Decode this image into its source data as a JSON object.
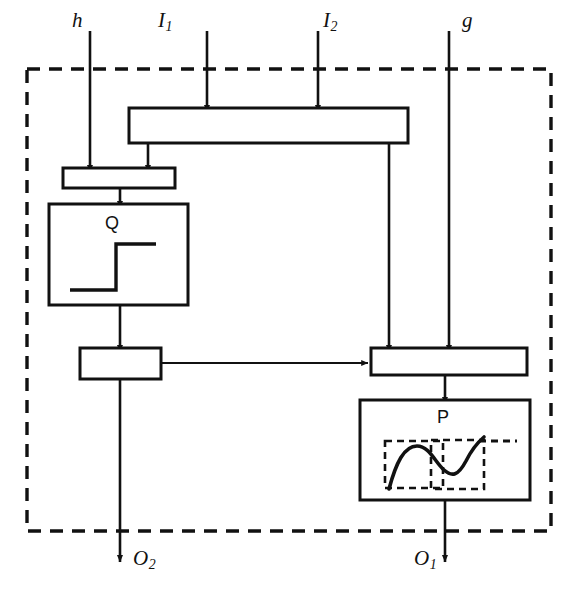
{
  "diagram": {
    "type": "block-diagram",
    "title": "",
    "boundary": {
      "style": "dashed",
      "x": 27,
      "y": 69,
      "width": 524,
      "height": 462
    },
    "colors": {
      "line": "#111111",
      "background": "#ffffff",
      "dashed": "#111111"
    },
    "inputs": [
      {
        "id": "h",
        "label": "h",
        "sub": "",
        "x": 90,
        "label_x": 72,
        "label_y": 10,
        "terminates_at": "splitter-box"
      },
      {
        "id": "I1",
        "label": "I",
        "sub": "1",
        "x": 207,
        "label_x": 158,
        "label_y": 10,
        "terminates_at": "top-bar"
      },
      {
        "id": "I2",
        "label": "I",
        "sub": "2",
        "x": 318,
        "label_x": 323,
        "label_y": 10,
        "terminates_at": "top-bar"
      },
      {
        "id": "g",
        "label": "g",
        "sub": "",
        "x": 449,
        "label_x": 462,
        "label_y": 10,
        "terminates_at": "right-bar"
      }
    ],
    "outputs": [
      {
        "id": "O1",
        "label": "O",
        "sub": "1",
        "x": 445,
        "label_x": 414,
        "label_y": 548,
        "source": "p-block"
      },
      {
        "id": "O2",
        "label": "O",
        "sub": "2",
        "x": 120,
        "label_x": 133,
        "label_y": 548,
        "source": "left-mid-box"
      }
    ],
    "blocks": [
      {
        "id": "top-bar",
        "label": "",
        "x": 129,
        "y": 108,
        "width": 279,
        "height": 35
      },
      {
        "id": "splitter-box",
        "label": "",
        "x": 63,
        "y": 168,
        "width": 112,
        "height": 20
      },
      {
        "id": "q-block",
        "label": "Q",
        "x": 49,
        "y": 204,
        "width": 139,
        "height": 101,
        "label_x": 105,
        "label_y": 214,
        "glyph": "step-function"
      },
      {
        "id": "left-mid-box",
        "label": "",
        "x": 80,
        "y": 348,
        "width": 81,
        "height": 31
      },
      {
        "id": "right-bar",
        "label": "",
        "x": 371,
        "y": 348,
        "width": 156,
        "height": 27
      },
      {
        "id": "p-block",
        "label": "P",
        "x": 360,
        "y": 400,
        "width": 170,
        "height": 100,
        "label_x": 437,
        "label_y": 408,
        "glyph": "s-curve-with-dashed-boxes"
      }
    ],
    "connections": [
      {
        "from": "top-bar",
        "to": "splitter-box",
        "x": 148,
        "kind": "vertical-arrow"
      },
      {
        "from": "top-bar",
        "to": "right-bar",
        "x": 389,
        "kind": "vertical-arrow"
      },
      {
        "from": "splitter-box",
        "to": "q-block",
        "x": 120,
        "kind": "vertical-arrow"
      },
      {
        "from": "q-block",
        "to": "left-mid-box",
        "x": 120,
        "kind": "vertical-arrow"
      },
      {
        "from": "left-mid-box",
        "to": "right-bar",
        "y": 363,
        "kind": "horizontal-arrow"
      },
      {
        "from": "left-mid-box",
        "to": "O2",
        "x": 120,
        "kind": "vertical-arrow"
      },
      {
        "from": "right-bar",
        "to": "p-block",
        "x": 445,
        "kind": "vertical-arrow"
      },
      {
        "from": "p-block",
        "to": "O1",
        "x": 445,
        "kind": "vertical-arrow"
      }
    ]
  }
}
